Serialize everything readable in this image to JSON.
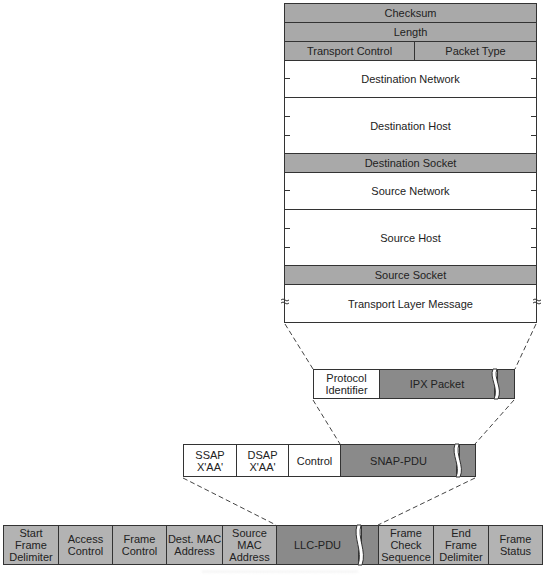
{
  "ipx_packet_fields": [
    {
      "label": "Checksum",
      "style": "shaded"
    },
    {
      "label": "Length",
      "style": "shaded"
    },
    {
      "label": "Transport Control",
      "style": "shaded"
    },
    {
      "label": "Packet Type",
      "style": "shaded"
    },
    {
      "label": "Destination Network",
      "style": "white"
    },
    {
      "label": "Destination Host",
      "style": "white"
    },
    {
      "label": "Destination Socket",
      "style": "shaded"
    },
    {
      "label": "Source Network",
      "style": "white"
    },
    {
      "label": "Source Host",
      "style": "white"
    },
    {
      "label": "Source Socket",
      "style": "shaded"
    },
    {
      "label": "Transport Layer Message",
      "style": "white"
    }
  ],
  "snap_frame": {
    "protocol_identifier": "Protocol Identifier",
    "payload": "IPX Packet"
  },
  "llc_frame": {
    "ssap": "SSAP X'AA'",
    "dsap": "DSAP X'AA'",
    "control": "Control",
    "payload": "SNAP-PDU"
  },
  "token_ring_frame": {
    "start_frame_delimiter": "Start Frame Delimiter",
    "access_control": "Access Control",
    "frame_control": "Frame Control",
    "dest_mac": "Dest. MAC Address",
    "source_mac": "Source MAC Address",
    "payload": "LLC-PDU",
    "fcs": "Frame Check Sequence",
    "end_frame_delimiter": "End Frame Delimiter",
    "frame_status": "Frame Status"
  },
  "colors": {
    "shaded_header": "#a9a9a9",
    "payload_dark": "#8a8a8a",
    "bottom_row": "#b3b3b3",
    "border": "#333333"
  }
}
